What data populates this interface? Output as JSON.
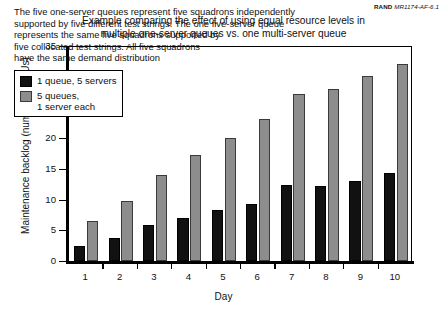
{
  "source_credit": {
    "organization": "RAND",
    "figure_id": "MR1174-AF-6.1"
  },
  "chart_data": {
    "type": "bar",
    "title": "Example comparing the effect of using equal resource levels in multiple one-server queues vs. one multi-server queue",
    "title_line1": "Example comparing the effect of using equal resource levels in",
    "title_line2": "multiple one-server queues vs. one multi-server queue",
    "xlabel": "Day",
    "ylabel": "Maintenance backlog (number of LRUs)",
    "categories": [
      "1",
      "2",
      "3",
      "4",
      "5",
      "6",
      "7",
      "8",
      "9",
      "10"
    ],
    "ylim": [
      0,
      35
    ],
    "yticks": [
      "0",
      "5",
      "10",
      "15",
      "20",
      "25",
      "30",
      "35"
    ],
    "grid": false,
    "legend_position": "upper-left-inside",
    "series": [
      {
        "name": "1 queue, 5 servers",
        "color": "#111111",
        "values": [
          2.5,
          3.7,
          5.8,
          7.0,
          8.3,
          9.3,
          12.3,
          12.2,
          13.0,
          14.2
        ]
      },
      {
        "name": "5 queues, 1 server each",
        "color": "#8d8d8d",
        "values": [
          6.5,
          9.8,
          14.0,
          17.2,
          20.0,
          23.0,
          27.0,
          27.8,
          30.0,
          32.0
        ]
      }
    ],
    "annotation": {
      "line1": "The five one-server queues represent five squadrons independently",
      "line2": "supported by five different test strings. The one five-server queue",
      "line3": "represents the same five squadrons supported by",
      "line4": "five collocated test strings. All five squadrons",
      "line5": "have the same demand distribution"
    }
  },
  "legend": {
    "items": [
      {
        "label": "1 queue, 5 servers",
        "swatch": "black"
      },
      {
        "label": "5 queues,\n1 server each",
        "swatch": "gray"
      }
    ]
  }
}
